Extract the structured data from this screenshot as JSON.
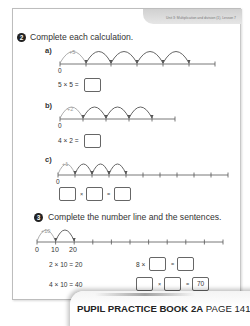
{
  "header": {
    "unit_text": "Unit 3: Multiplication and division (1), Lesson 7"
  },
  "question2": {
    "number": "2",
    "instruction": "Complete each calculation.",
    "parts": [
      {
        "label": "a)",
        "jump_label": "+5",
        "start_label": "0",
        "ticks": 7,
        "jumps": 5,
        "equation": "5 × 5 =",
        "answer": ""
      },
      {
        "label": "b)",
        "jump_label": "+2",
        "start_label": "0",
        "ticks": 6,
        "jumps": 4,
        "equation": "4 × 2 =",
        "answer": ""
      },
      {
        "label": "c)",
        "jump_label": "+1",
        "start_label": "0",
        "ticks": 11,
        "jumps": 4,
        "op1": "×",
        "op2": "=",
        "box1": "",
        "box2": "",
        "box3": ""
      }
    ]
  },
  "question3": {
    "number": "3",
    "instruction": "Complete the number line and the sentences.",
    "jump_label": "+10",
    "tick_labels": [
      "0",
      "10",
      "20"
    ],
    "ticks": 11,
    "jumps": 2,
    "sentences_left": [
      "2 × 10 = 20",
      "4 × 10 = 40"
    ],
    "sentence_right_1": {
      "prefix": "8 ×",
      "op": "=",
      "box1": "",
      "box2": ""
    },
    "sentence_right_2": {
      "op1": "×",
      "op2": "=",
      "box1": "",
      "box2": "",
      "box3": "70"
    },
    "marks": "[4]"
  },
  "footer": {
    "book": "PUPIL PRACTICE BOOK 2A",
    "page": "PAGE 141"
  }
}
